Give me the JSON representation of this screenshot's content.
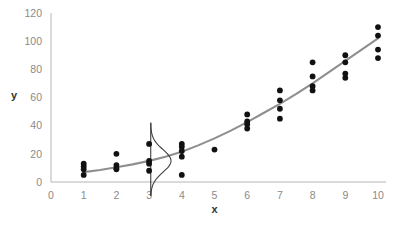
{
  "chart_data": {
    "type": "scatter",
    "title": "",
    "xlabel": "x",
    "ylabel": "y",
    "xlim": [
      0,
      10
    ],
    "ylim": [
      0,
      120
    ],
    "xticks": [
      0,
      1,
      2,
      3,
      4,
      5,
      6,
      7,
      8,
      9,
      10
    ],
    "xtick_labels": [
      "0",
      "1",
      "2",
      "3",
      "4",
      "5",
      "6",
      "7",
      "8",
      "9",
      "10"
    ],
    "yticks": [
      0,
      20,
      40,
      60,
      80,
      100,
      120
    ],
    "ytick_labels": [
      "0",
      "20",
      "40",
      "60",
      "80",
      "100",
      "120"
    ],
    "grid": false,
    "legend": "none",
    "point_color": "#111111",
    "curve_color": "#8f8f8f",
    "axis_color": "#b5b5b5",
    "tick_label_color": "#8a8a8a",
    "points": [
      {
        "x": 1,
        "y": 13
      },
      {
        "x": 1,
        "y": 11
      },
      {
        "x": 1,
        "y": 9
      },
      {
        "x": 1,
        "y": 5
      },
      {
        "x": 2,
        "y": 20
      },
      {
        "x": 2,
        "y": 12
      },
      {
        "x": 2,
        "y": 10
      },
      {
        "x": 2,
        "y": 9
      },
      {
        "x": 3,
        "y": 27
      },
      {
        "x": 3,
        "y": 15
      },
      {
        "x": 3,
        "y": 13
      },
      {
        "x": 3,
        "y": 8
      },
      {
        "x": 4,
        "y": 27
      },
      {
        "x": 4,
        "y": 25
      },
      {
        "x": 4,
        "y": 22
      },
      {
        "x": 4,
        "y": 18
      },
      {
        "x": 4,
        "y": 5
      },
      {
        "x": 5,
        "y": 23
      },
      {
        "x": 6,
        "y": 48
      },
      {
        "x": 6,
        "y": 43
      },
      {
        "x": 6,
        "y": 41
      },
      {
        "x": 6,
        "y": 38
      },
      {
        "x": 7,
        "y": 65
      },
      {
        "x": 7,
        "y": 58
      },
      {
        "x": 7,
        "y": 52
      },
      {
        "x": 7,
        "y": 45
      },
      {
        "x": 8,
        "y": 85
      },
      {
        "x": 8,
        "y": 75
      },
      {
        "x": 8,
        "y": 68
      },
      {
        "x": 8,
        "y": 65
      },
      {
        "x": 9,
        "y": 90
      },
      {
        "x": 9,
        "y": 85
      },
      {
        "x": 9,
        "y": 77
      },
      {
        "x": 9,
        "y": 74
      },
      {
        "x": 10,
        "y": 110
      },
      {
        "x": 10,
        "y": 104
      },
      {
        "x": 10,
        "y": 94
      },
      {
        "x": 10,
        "y": 88
      }
    ],
    "fit_curve": {
      "name": "fitted regression curve",
      "x": [
        1,
        1.5,
        2,
        2.5,
        3,
        3.5,
        4,
        4.5,
        5,
        5.5,
        6,
        6.5,
        7,
        7.5,
        8,
        8.5,
        9,
        9.5,
        10
      ],
      "y": [
        7,
        8.5,
        10.5,
        12.5,
        15,
        18,
        21.5,
        26,
        31,
        36.5,
        42.5,
        49,
        55.5,
        62.5,
        70,
        78,
        86,
        94,
        102
      ]
    },
    "distribution_overlay": {
      "name": "normal distribution of residuals at x=3",
      "at_x": 3.05,
      "mean_y": 15,
      "sd_y": 8,
      "y_from": -10,
      "y_to": 42,
      "peak_width_x_units": 0.62
    }
  }
}
